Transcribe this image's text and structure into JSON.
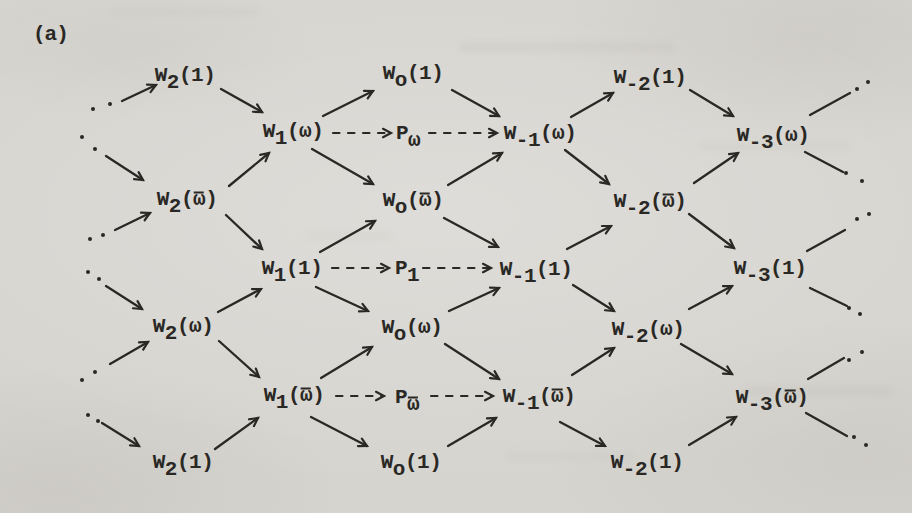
{
  "figure_label": "(a)",
  "colors": {
    "ink": "#2a2825",
    "paper": "#d6d4cf"
  },
  "nodes": [
    {
      "id": "w2-1-a",
      "base": "W",
      "sub": "2",
      "arg": "1",
      "x": 185,
      "y": 75
    },
    {
      "id": "wo-1-a",
      "base": "W",
      "sub": "o",
      "arg": "1",
      "x": 413,
      "y": 73
    },
    {
      "id": "wm2-1-a",
      "base": "W",
      "sub": "-2",
      "arg": "1",
      "x": 650,
      "y": 77
    },
    {
      "id": "w1-w",
      "base": "W",
      "sub": "1",
      "arg": "ω",
      "x": 293,
      "y": 131
    },
    {
      "id": "p-w",
      "base": "P",
      "sub": "ω",
      "arg": null,
      "x": 408,
      "y": 133
    },
    {
      "id": "wm1-w",
      "base": "W",
      "sub": "-1",
      "arg": "ω",
      "x": 540,
      "y": 133
    },
    {
      "id": "wm3-w",
      "base": "W",
      "sub": "-3",
      "arg": "ω",
      "x": 773,
      "y": 135
    },
    {
      "id": "w2-wbar",
      "base": "W",
      "sub": "2",
      "arg": "ω",
      "arg_bar": true,
      "x": 187,
      "y": 199
    },
    {
      "id": "wo-wbar",
      "base": "W",
      "sub": "o",
      "arg": "ω",
      "arg_bar": true,
      "x": 413,
      "y": 200
    },
    {
      "id": "wm2-wbar",
      "base": "W",
      "sub": "-2",
      "arg": "ω",
      "arg_bar": true,
      "x": 650,
      "y": 201
    },
    {
      "id": "w1-1",
      "base": "W",
      "sub": "1",
      "arg": "1",
      "x": 292,
      "y": 268
    },
    {
      "id": "p-1",
      "base": "P",
      "sub": "1",
      "arg": null,
      "x": 407,
      "y": 268
    },
    {
      "id": "wm1-1",
      "base": "W",
      "sub": "-1",
      "arg": "1",
      "x": 536,
      "y": 269
    },
    {
      "id": "wm3-1",
      "base": "W",
      "sub": "-3",
      "arg": "1",
      "x": 770,
      "y": 268
    },
    {
      "id": "w2-w",
      "base": "W",
      "sub": "2",
      "arg": "ω",
      "x": 183,
      "y": 326
    },
    {
      "id": "wo-w",
      "base": "W",
      "sub": "o",
      "arg": "ω",
      "x": 412,
      "y": 327
    },
    {
      "id": "wm2-w",
      "base": "W",
      "sub": "-2",
      "arg": "ω",
      "x": 648,
      "y": 329
    },
    {
      "id": "w1-wbar",
      "base": "W",
      "sub": "1",
      "arg": "ω",
      "arg_bar": true,
      "x": 294,
      "y": 395
    },
    {
      "id": "p-wbar",
      "base": "P",
      "sub": "ω",
      "sub_bar": true,
      "arg": null,
      "x": 407,
      "y": 397
    },
    {
      "id": "wm1-wbar",
      "base": "W",
      "sub": "-1",
      "arg": "ω",
      "arg_bar": true,
      "x": 539,
      "y": 396
    },
    {
      "id": "wm3-wbar",
      "base": "W",
      "sub": "-3",
      "arg": "ω",
      "arg_bar": true,
      "x": 772,
      "y": 397
    },
    {
      "id": "w2-1-g",
      "base": "W",
      "sub": "2",
      "arg": "1",
      "x": 183,
      "y": 462
    },
    {
      "id": "wo-1-g",
      "base": "W",
      "sub": "o",
      "arg": "1",
      "x": 411,
      "y": 462
    },
    {
      "id": "wm2-1-g",
      "base": "W",
      "sub": "-2",
      "arg": "1",
      "x": 647,
      "y": 462
    }
  ],
  "edges": [
    {
      "from": "dots-left-1",
      "to": "w2-1-a",
      "style": "solid",
      "head": true,
      "x1": 122,
      "y1": 101,
      "x2": 156,
      "y2": 85
    },
    {
      "from": "dots-left-2",
      "to": "w2-wbar",
      "style": "solid",
      "head": true,
      "x1": 106,
      "y1": 156,
      "x2": 143,
      "y2": 180
    },
    {
      "from": "dots-left-3",
      "to": "w2-wbar",
      "style": "solid",
      "head": true,
      "x1": 115,
      "y1": 230,
      "x2": 150,
      "y2": 213
    },
    {
      "from": "dots-left-4",
      "to": "w2-w",
      "style": "solid",
      "head": true,
      "x1": 106,
      "y1": 286,
      "x2": 142,
      "y2": 309
    },
    {
      "from": "dots-left-5",
      "to": "w2-w",
      "style": "solid",
      "head": true,
      "x1": 110,
      "y1": 364,
      "x2": 148,
      "y2": 342
    },
    {
      "from": "dots-left-6",
      "to": "w2-1-g",
      "style": "solid",
      "head": true,
      "x1": 102,
      "y1": 423,
      "x2": 139,
      "y2": 446
    },
    {
      "from": "w2-1-a",
      "to": "w1-w",
      "style": "solid",
      "head": true,
      "x1": 221,
      "y1": 89,
      "x2": 262,
      "y2": 112
    },
    {
      "from": "w2-wbar",
      "to": "w1-w",
      "style": "solid",
      "head": true,
      "x1": 229,
      "y1": 186,
      "x2": 269,
      "y2": 153
    },
    {
      "from": "w2-wbar",
      "to": "w1-1",
      "style": "solid",
      "head": true,
      "x1": 226,
      "y1": 215,
      "x2": 262,
      "y2": 249
    },
    {
      "from": "w2-w",
      "to": "w1-1",
      "style": "solid",
      "head": true,
      "x1": 218,
      "y1": 312,
      "x2": 261,
      "y2": 289
    },
    {
      "from": "w2-w",
      "to": "w1-wbar",
      "style": "solid",
      "head": true,
      "x1": 219,
      "y1": 341,
      "x2": 259,
      "y2": 377
    },
    {
      "from": "w2-1-g",
      "to": "w1-wbar",
      "style": "solid",
      "head": true,
      "x1": 215,
      "y1": 449,
      "x2": 258,
      "y2": 418
    },
    {
      "from": "w1-w",
      "to": "wo-1-a",
      "style": "solid",
      "head": true,
      "x1": 323,
      "y1": 116,
      "x2": 373,
      "y2": 91
    },
    {
      "from": "w1-w",
      "to": "wo-wbar",
      "style": "solid",
      "head": true,
      "x1": 312,
      "y1": 149,
      "x2": 373,
      "y2": 184
    },
    {
      "from": "w1-1",
      "to": "wo-wbar",
      "style": "solid",
      "head": true,
      "x1": 320,
      "y1": 252,
      "x2": 375,
      "y2": 221
    },
    {
      "from": "w1-1",
      "to": "wo-w",
      "style": "solid",
      "head": true,
      "x1": 316,
      "y1": 287,
      "x2": 368,
      "y2": 311
    },
    {
      "from": "w1-wbar",
      "to": "wo-w",
      "style": "solid",
      "head": true,
      "x1": 321,
      "y1": 378,
      "x2": 372,
      "y2": 347
    },
    {
      "from": "w1-wbar",
      "to": "wo-1-g",
      "style": "solid",
      "head": true,
      "x1": 311,
      "y1": 417,
      "x2": 367,
      "y2": 446
    },
    {
      "from": "wo-1-a",
      "to": "wm1-w",
      "style": "solid",
      "head": true,
      "x1": 452,
      "y1": 90,
      "x2": 499,
      "y2": 116
    },
    {
      "from": "wo-wbar",
      "to": "wm1-w",
      "style": "solid",
      "head": true,
      "x1": 448,
      "y1": 185,
      "x2": 502,
      "y2": 153
    },
    {
      "from": "wo-wbar",
      "to": "wm1-1",
      "style": "solid",
      "head": true,
      "x1": 444,
      "y1": 218,
      "x2": 498,
      "y2": 247
    },
    {
      "from": "wo-w",
      "to": "wm1-1",
      "style": "solid",
      "head": true,
      "x1": 449,
      "y1": 311,
      "x2": 499,
      "y2": 288
    },
    {
      "from": "wo-w",
      "to": "wm1-wbar",
      "style": "solid",
      "head": true,
      "x1": 445,
      "y1": 344,
      "x2": 499,
      "y2": 379
    },
    {
      "from": "wo-1-g",
      "to": "wm1-wbar",
      "style": "solid",
      "head": true,
      "x1": 448,
      "y1": 446,
      "x2": 496,
      "y2": 418
    },
    {
      "from": "wm1-w",
      "to": "wm2-1-a",
      "style": "solid",
      "head": true,
      "x1": 571,
      "y1": 117,
      "x2": 613,
      "y2": 93
    },
    {
      "from": "wm1-w",
      "to": "wm2-wbar",
      "style": "solid",
      "head": true,
      "x1": 565,
      "y1": 150,
      "x2": 609,
      "y2": 184
    },
    {
      "from": "wm1-1",
      "to": "wm2-wbar",
      "style": "solid",
      "head": true,
      "x1": 567,
      "y1": 249,
      "x2": 611,
      "y2": 226
    },
    {
      "from": "wm1-1",
      "to": "wm2-w",
      "style": "solid",
      "head": true,
      "x1": 573,
      "y1": 285,
      "x2": 614,
      "y2": 311
    },
    {
      "from": "wm1-wbar",
      "to": "wm2-w",
      "style": "solid",
      "head": true,
      "x1": 572,
      "y1": 375,
      "x2": 614,
      "y2": 348
    },
    {
      "from": "wm1-wbar",
      "to": "wm2-1-g",
      "style": "solid",
      "head": true,
      "x1": 560,
      "y1": 422,
      "x2": 605,
      "y2": 446
    },
    {
      "from": "wm2-1-a",
      "to": "wm3-w",
      "style": "solid",
      "head": true,
      "x1": 690,
      "y1": 90,
      "x2": 733,
      "y2": 116
    },
    {
      "from": "wm2-wbar",
      "to": "wm3-w",
      "style": "solid",
      "head": true,
      "x1": 694,
      "y1": 183,
      "x2": 738,
      "y2": 153
    },
    {
      "from": "wm2-wbar",
      "to": "wm3-1",
      "style": "solid",
      "head": true,
      "x1": 689,
      "y1": 214,
      "x2": 734,
      "y2": 248
    },
    {
      "from": "wm2-w",
      "to": "wm3-1",
      "style": "solid",
      "head": true,
      "x1": 689,
      "y1": 309,
      "x2": 732,
      "y2": 286
    },
    {
      "from": "wm2-w",
      "to": "wm3-wbar",
      "style": "solid",
      "head": true,
      "x1": 681,
      "y1": 344,
      "x2": 732,
      "y2": 374
    },
    {
      "from": "wm2-1-g",
      "to": "wm3-wbar",
      "style": "solid",
      "head": true,
      "x1": 689,
      "y1": 445,
      "x2": 736,
      "y2": 417
    },
    {
      "from": "wm3-w",
      "to": "dots-right-1",
      "style": "solid",
      "head": false,
      "x1": 810,
      "y1": 115,
      "x2": 850,
      "y2": 93
    },
    {
      "from": "wm3-w",
      "to": "dots-right-2",
      "style": "solid",
      "head": false,
      "x1": 805,
      "y1": 152,
      "x2": 843,
      "y2": 172
    },
    {
      "from": "wm3-1",
      "to": "dots-right-3",
      "style": "solid",
      "head": false,
      "x1": 807,
      "y1": 251,
      "x2": 845,
      "y2": 230
    },
    {
      "from": "wm3-1",
      "to": "dots-right-4",
      "style": "solid",
      "head": false,
      "x1": 810,
      "y1": 288,
      "x2": 847,
      "y2": 306
    },
    {
      "from": "wm3-wbar",
      "to": "dots-right-5",
      "style": "solid",
      "head": false,
      "x1": 808,
      "y1": 379,
      "x2": 844,
      "y2": 358
    },
    {
      "from": "wm3-wbar",
      "to": "dots-right-6",
      "style": "solid",
      "head": false,
      "x1": 806,
      "y1": 413,
      "x2": 847,
      "y2": 436
    },
    {
      "from": "w1-w",
      "to": "p-w",
      "style": "dashed",
      "head": true,
      "x1": 333,
      "y1": 133,
      "x2": 391,
      "y2": 133
    },
    {
      "from": "p-w",
      "to": "wm1-w",
      "style": "dashed",
      "head": true,
      "x1": 429,
      "y1": 133,
      "x2": 497,
      "y2": 133
    },
    {
      "from": "w1-1",
      "to": "p-1",
      "style": "dashed",
      "head": true,
      "x1": 332,
      "y1": 268,
      "x2": 389,
      "y2": 268
    },
    {
      "from": "p-1",
      "to": "wm1-1",
      "style": "dashed",
      "head": true,
      "x1": 423,
      "y1": 268,
      "x2": 491,
      "y2": 268
    },
    {
      "from": "w1-wbar",
      "to": "p-wbar",
      "style": "dashed",
      "head": true,
      "x1": 336,
      "y1": 396,
      "x2": 384,
      "y2": 396
    },
    {
      "from": "p-wbar",
      "to": "wm1-wbar",
      "style": "dashed",
      "head": true,
      "x1": 431,
      "y1": 396,
      "x2": 493,
      "y2": 396
    }
  ],
  "continuation_dots": [
    {
      "id": "left-1",
      "points": [
        [
          93,
          109
        ],
        [
          110,
          104
        ]
      ]
    },
    {
      "id": "left-2",
      "points": [
        [
          82,
          137
        ],
        [
          95,
          149
        ]
      ]
    },
    {
      "id": "left-3",
      "points": [
        [
          90,
          239
        ],
        [
          103,
          235
        ]
      ]
    },
    {
      "id": "left-4",
      "points": [
        [
          88,
          272
        ],
        [
          99,
          279
        ]
      ]
    },
    {
      "id": "left-5",
      "points": [
        [
          82,
          380
        ],
        [
          95,
          372
        ]
      ]
    },
    {
      "id": "left-6",
      "points": [
        [
          88,
          415
        ],
        [
          98,
          421
        ]
      ]
    },
    {
      "id": "right-1",
      "points": [
        [
          857,
          89
        ],
        [
          868,
          82
        ]
      ]
    },
    {
      "id": "right-2",
      "points": [
        [
          846,
          173
        ],
        [
          862,
          181
        ]
      ]
    },
    {
      "id": "right-3",
      "points": [
        [
          857,
          219
        ],
        [
          869,
          214
        ]
      ]
    },
    {
      "id": "right-4",
      "points": [
        [
          849,
          308
        ],
        [
          860,
          314
        ]
      ]
    },
    {
      "id": "right-5",
      "points": [
        [
          849,
          360
        ],
        [
          862,
          352
        ]
      ]
    },
    {
      "id": "right-6",
      "points": [
        [
          854,
          437
        ],
        [
          866,
          445
        ]
      ]
    }
  ]
}
